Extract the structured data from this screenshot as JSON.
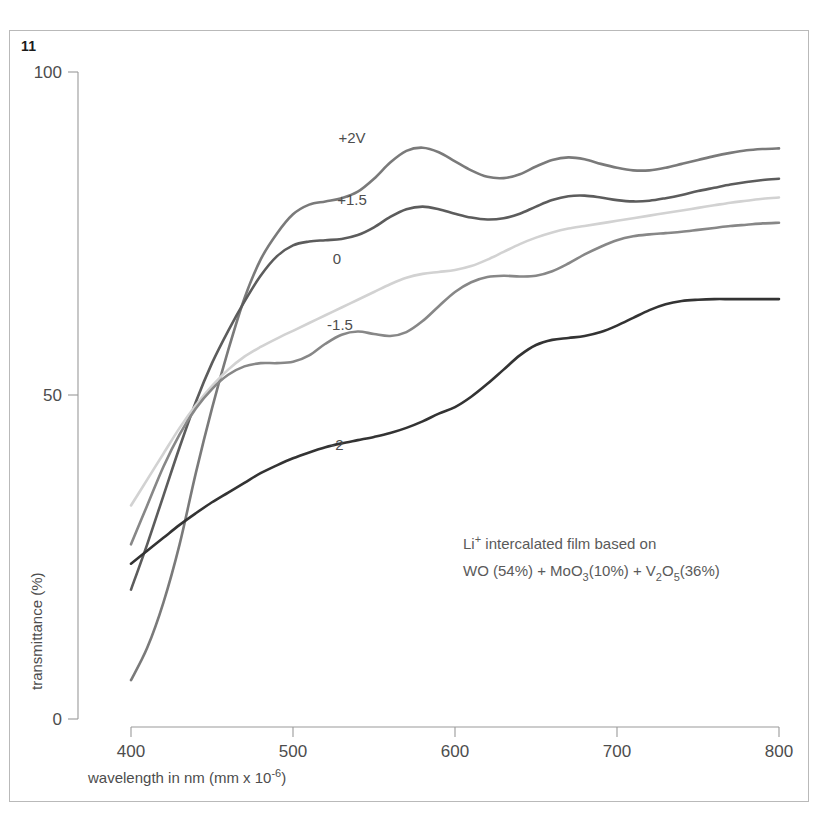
{
  "figure": {
    "number": "11",
    "caption_annotation_line1": "Li",
    "caption_annotation_line1_sup": "+",
    "caption_annotation_line1_rest": " intercalated film based on"
  },
  "annotation": {
    "line1_prefix": "Li",
    "line1_superscript": "+",
    "line1_suffix": " intercalated film based on",
    "line2_part1": "WO (54%) + MoO",
    "line2_sub1": "3",
    "line2_part2": "(10%) + V",
    "line2_sub2": "2",
    "line2_part3": "O",
    "line2_sub3": "5",
    "line2_part4": "(36%)"
  },
  "axes": {
    "x_title_prefix": "wavelength in nm (mm x 10",
    "x_title_exponent": "-6",
    "x_title_suffix": ")",
    "y_title": "transmittance (%)",
    "x_ticks": [
      "400",
      "500",
      "600",
      "700",
      "800"
    ],
    "y_ticks": [
      "100",
      "50",
      "0"
    ]
  },
  "chart_data": {
    "type": "line",
    "title": "",
    "xlabel": "wavelength in nm (mm x 10^-6)",
    "ylabel": "transmittance (%)",
    "xlim": [
      400,
      800
    ],
    "ylim": [
      0,
      100
    ],
    "x_ticks": [
      400,
      500,
      600,
      700,
      800
    ],
    "y_ticks": [
      0,
      50,
      100
    ],
    "grid": false,
    "legend_position": "inline-labels",
    "annotation": "Li+ intercalated film based on WO (54%) + MoO3(10%) + V2O5(36%)",
    "x": [
      400,
      410,
      420,
      430,
      440,
      450,
      460,
      470,
      480,
      490,
      500,
      510,
      520,
      530,
      540,
      550,
      560,
      570,
      580,
      590,
      600,
      610,
      620,
      630,
      640,
      650,
      660,
      670,
      680,
      690,
      700,
      710,
      720,
      730,
      740,
      750,
      760,
      770,
      780,
      790,
      800
    ],
    "series": [
      {
        "name": "+2V",
        "label": "+2V",
        "color": "#7a7a7a",
        "values": [
          6,
          11,
          18,
          27,
          38,
          48,
          57,
          65,
          71,
          75,
          78,
          79.5,
          80,
          80.5,
          81.5,
          83.5,
          86,
          87.8,
          88.3,
          87.6,
          86.2,
          84.8,
          83.8,
          83.6,
          84.2,
          85.4,
          86.4,
          86.8,
          86.5,
          85.8,
          85.2,
          84.8,
          84.8,
          85.2,
          85.8,
          86.4,
          87,
          87.5,
          87.9,
          88.1,
          88.2
        ]
      },
      {
        "name": "+1.5",
        "label": "+1.5",
        "color": "#5c5c5c",
        "values": [
          20,
          27,
          34.5,
          42,
          49,
          55,
          60,
          64.5,
          68.5,
          71.5,
          73.2,
          73.8,
          74,
          74.2,
          74.8,
          76,
          77.6,
          78.8,
          79.2,
          78.8,
          78.1,
          77.5,
          77.2,
          77.4,
          78.1,
          79.2,
          80.2,
          80.8,
          80.9,
          80.6,
          80.2,
          80,
          80.1,
          80.5,
          81,
          81.6,
          82.1,
          82.6,
          83,
          83.3,
          83.5
        ]
      },
      {
        "name": "0",
        "label": "0",
        "color": "#d2d2d2",
        "values": [
          33,
          37,
          41,
          45,
          48.5,
          51.5,
          54,
          56,
          57.5,
          58.8,
          60,
          61.2,
          62.4,
          63.6,
          64.8,
          66,
          67.2,
          68.2,
          68.8,
          69.1,
          69.4,
          70,
          71,
          72.2,
          73.4,
          74.4,
          75.2,
          75.8,
          76.2,
          76.6,
          77,
          77.4,
          77.8,
          78.2,
          78.6,
          79,
          79.4,
          79.8,
          80.1,
          80.4,
          80.6
        ]
      },
      {
        "name": "-1.5",
        "label": "-1.5",
        "color": "#878787",
        "values": [
          27,
          33,
          39,
          44,
          48,
          51,
          53.2,
          54.5,
          55,
          55,
          55.2,
          56.2,
          58,
          59.4,
          59.9,
          59.5,
          59.2,
          59.8,
          61.5,
          63.8,
          66,
          67.5,
          68.3,
          68.5,
          68.4,
          68.5,
          69.2,
          70.4,
          71.8,
          73,
          74,
          74.6,
          74.9,
          75.1,
          75.3,
          75.6,
          75.9,
          76.2,
          76.4,
          76.6,
          76.7
        ]
      },
      {
        "name": "-2",
        "label": "-2",
        "color": "#333333",
        "values": [
          24,
          26,
          28,
          30,
          31.8,
          33.5,
          35,
          36.5,
          38,
          39.2,
          40.3,
          41.2,
          42,
          42.6,
          43.1,
          43.6,
          44.2,
          45,
          46,
          47.2,
          48.2,
          49.8,
          51.8,
          54,
          56.2,
          57.8,
          58.6,
          58.9,
          59.2,
          59.8,
          60.8,
          62,
          63.2,
          64.1,
          64.6,
          64.8,
          64.9,
          64.9,
          64.9,
          64.9,
          64.9
        ]
      }
    ],
    "curve_label_positions": [
      {
        "name": "+2V",
        "x": 352,
        "y": 143
      },
      {
        "name": "+1.5",
        "x": 352,
        "y": 205
      },
      {
        "name": "0",
        "x": 337,
        "y": 264
      },
      {
        "name": "-1.5",
        "x": 340,
        "y": 330
      },
      {
        "name": "-2",
        "x": 337,
        "y": 450
      }
    ]
  }
}
